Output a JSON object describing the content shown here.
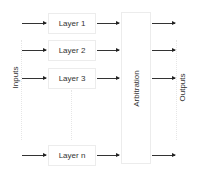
{
  "diagram": {
    "inputs_label": "Inputs",
    "outputs_label": "Outputs",
    "arbitration_label": "Arbitration",
    "layers": [
      {
        "label": "Layer 1"
      },
      {
        "label": "Layer 2"
      },
      {
        "label": "Layer 3"
      },
      {
        "label": "Layer n"
      }
    ],
    "colors": {
      "arrow": "#333333",
      "box_border": "#ececec",
      "text": "#333333"
    }
  }
}
